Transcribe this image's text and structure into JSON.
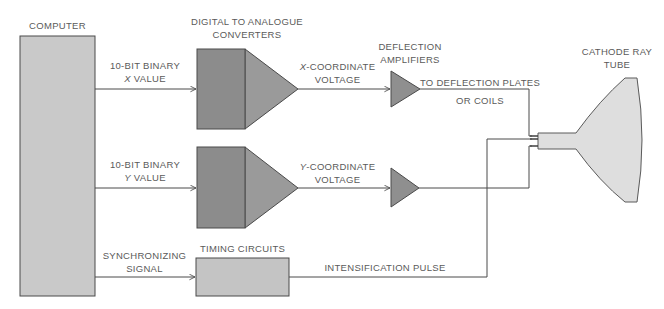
{
  "diagram": {
    "colors": {
      "background": "#ffffff",
      "computer_fill": "#c9c9c9",
      "dac_fill": "#8f8f8f",
      "amp_fill": "#8f8f8f",
      "timing_fill": "#c4c4c4",
      "crt_fill": "#dedede",
      "line": "#4a4a4a",
      "text": "#5a5a5a"
    },
    "nodes": {
      "computer": {
        "label": "COMPUTER"
      },
      "dac": {
        "label_line1": "DIGITAL TO ANALOGUE",
        "label_line2": "CONVERTERS"
      },
      "amplifiers": {
        "label_line1": "DEFLECTION",
        "label_line2": "AMPLIFIERS"
      },
      "timing": {
        "label": "TIMING CIRCUITS"
      },
      "crt": {
        "label_line1": "CATHODE RAY",
        "label_line2": "TUBE"
      }
    },
    "edges": {
      "x_binary": {
        "line1": "10-BIT BINARY",
        "line2_var": "X",
        "line2_rest": " VALUE"
      },
      "y_binary": {
        "line1": "10-BIT BINARY",
        "line2_var": "Y",
        "line2_rest": " VALUE"
      },
      "x_voltage": {
        "line1_var": "X",
        "line1_rest": "-COORDINATE",
        "line2": "VOLTAGE"
      },
      "y_voltage": {
        "line1_var": "Y",
        "line1_rest": "-COORDINATE",
        "line2": "VOLTAGE"
      },
      "deflection_out": {
        "line1": "TO DEFLECTION PLATES",
        "line2": "OR COILS"
      },
      "sync": {
        "line1": "SYNCHRONIZING",
        "line2": "SIGNAL"
      },
      "intensification": {
        "label": "INTENSIFICATION PULSE"
      }
    }
  }
}
